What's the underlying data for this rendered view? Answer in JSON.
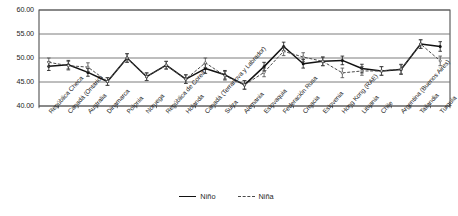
{
  "chart_data": {
    "type": "line",
    "title": "",
    "subtitle": "",
    "xlabel": "",
    "ylabel": "",
    "ylim": [
      40.0,
      60.0
    ],
    "ytick_step": 5.0,
    "ytick_labels": [
      "60.00",
      "55.00",
      "50.00",
      "45.00",
      "40.00"
    ],
    "ytick_values": [
      60.0,
      55.0,
      50.0,
      45.0,
      40.0
    ],
    "grid": true,
    "grid_axis": "y",
    "legend_position": "bottom",
    "error_bars": true,
    "categories": [
      "República Checa",
      "Canadá (Ontario)",
      "Australia",
      "Dinamarca",
      "Polonia",
      "Noruega",
      "República de Corea",
      "Holanda",
      "Canadá (Terranova y Labrador)",
      "Suiza",
      "Alemania",
      "Eslovaquia",
      "Federación Rusa",
      "Croacia",
      "Eslovenia",
      "Hong Kong (RAE)",
      "Lituania",
      "Chile",
      "Argentina (Buenos Aires)",
      "Tailandia",
      "Turquía"
    ],
    "series": [
      {
        "name": "Niño",
        "style": "solid",
        "values": [
          48.3,
          48.6,
          47.0,
          45.1,
          50.0,
          46.1,
          48.5,
          45.6,
          47.8,
          46.5,
          44.4,
          48.2,
          52.4,
          48.8,
          49.3,
          49.5,
          47.8,
          47.3,
          47.6,
          52.9,
          52.4
        ],
        "errors": [
          0.9,
          0.9,
          0.8,
          0.8,
          0.9,
          0.8,
          0.8,
          0.9,
          1.0,
          0.9,
          0.9,
          0.9,
          0.9,
          0.9,
          0.9,
          0.9,
          0.9,
          0.9,
          1.0,
          0.9,
          1.0
        ]
      },
      {
        "name": "Niña",
        "style": "dashed",
        "values": [
          49.1,
          48.4,
          48.1,
          45.1,
          50.0,
          46.1,
          48.5,
          45.6,
          49.0,
          46.3,
          44.4,
          47.0,
          51.4,
          50.2,
          49.3,
          46.9,
          47.3,
          47.3,
          47.7,
          52.9,
          49.4
        ],
        "errors": [
          0.9,
          0.9,
          0.9,
          0.8,
          0.9,
          0.8,
          0.8,
          0.9,
          1.0,
          0.9,
          0.9,
          0.9,
          0.9,
          0.9,
          0.9,
          1.0,
          0.9,
          0.9,
          1.0,
          0.9,
          1.0
        ]
      }
    ],
    "legend": [
      {
        "label": "Niño",
        "style": "solid"
      },
      {
        "label": "Niña",
        "style": "dashed"
      }
    ],
    "colors": {
      "nino_line": "#121212",
      "nina_line": "#4a4a4a",
      "grid": "#6e6e6e",
      "axis": "#2b2b2b",
      "text": "#232323",
      "background": "#ffffff"
    }
  }
}
